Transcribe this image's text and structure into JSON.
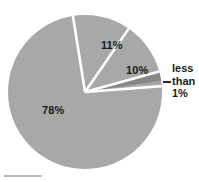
{
  "chart_data": {
    "type": "pie",
    "title": "",
    "subtitle": "",
    "xlabel": "",
    "ylabel": "",
    "legend_position": "none",
    "grid": false,
    "categories": [
      "78%",
      "11%",
      "10%",
      "less than 1%"
    ],
    "values": [
      78,
      11,
      10,
      0.5
    ],
    "labels": [
      "78%",
      "11%",
      "10%",
      "less than 1%"
    ],
    "slices": [
      {
        "label": "11%",
        "value": 11,
        "color": "#a8a8a8",
        "start_angle_deg": 351.0,
        "end_angle_deg": 390.6,
        "label_placement": "inside"
      },
      {
        "label": "10%",
        "value": 10,
        "color": "#a8a8a8",
        "start_angle_deg": 394.6,
        "end_angle_deg": 430.6,
        "label_placement": "inside"
      },
      {
        "label": "less than 1%",
        "value": 0.5,
        "color": "#878787",
        "start_angle_deg": 434.6,
        "end_angle_deg": 441.6,
        "label_placement": "outside-right-callout"
      },
      {
        "label": "78%",
        "value": 78,
        "color": "#a8a8a8",
        "start_angle_deg": 445.6,
        "end_angle_deg": 711.0,
        "label_placement": "inside"
      }
    ],
    "colors": {
      "slice_fill": "#a8a8a8",
      "sliver_fill": "#878787",
      "separator": "#ffffff",
      "background": "#ffffff",
      "label_text": "#1b1b1b",
      "leader_line": "#2b2b2b"
    },
    "geometry": {
      "center_x": 85,
      "center_y": 92,
      "radius": 77
    }
  },
  "labels": {
    "pct_78": "78%",
    "pct_11": "11%",
    "pct_10": "10%",
    "callout_line1": "less",
    "callout_line2": "than",
    "callout_line3": "1%"
  }
}
